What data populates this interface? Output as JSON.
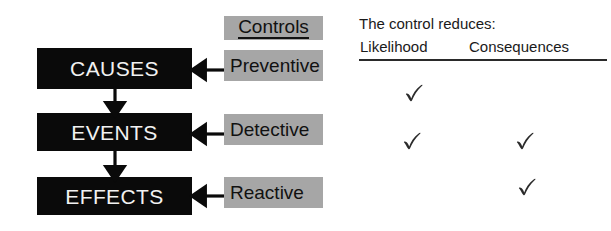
{
  "diagram": {
    "chain": {
      "boxes": [
        {
          "label": "CAUSES"
        },
        {
          "label": "EVENTS"
        },
        {
          "label": "EFFECTS"
        }
      ]
    },
    "controls": {
      "header": "Controls",
      "items": [
        {
          "label": "Preventive"
        },
        {
          "label": "Detective"
        },
        {
          "label": "Reactive"
        }
      ]
    },
    "table": {
      "caption": "The control reduces:",
      "columns": [
        "Likelihood",
        "Consequences"
      ],
      "rows": [
        {
          "control": "Preventive",
          "likelihood": true,
          "consequences": false
        },
        {
          "control": "Detective",
          "likelihood": true,
          "consequences": true
        },
        {
          "control": "Reactive",
          "likelihood": false,
          "consequences": true
        }
      ],
      "check_glyph": "check-mark-icon"
    },
    "colors": {
      "chain_box_fill": "#0a0a0a",
      "chain_box_text": "#f2f2f2",
      "control_box_fill": "#a6a6a6",
      "control_box_text": "#111111",
      "rule": "#2a2a2a",
      "check": "#2b2b2b",
      "background": "#ffffff"
    }
  }
}
